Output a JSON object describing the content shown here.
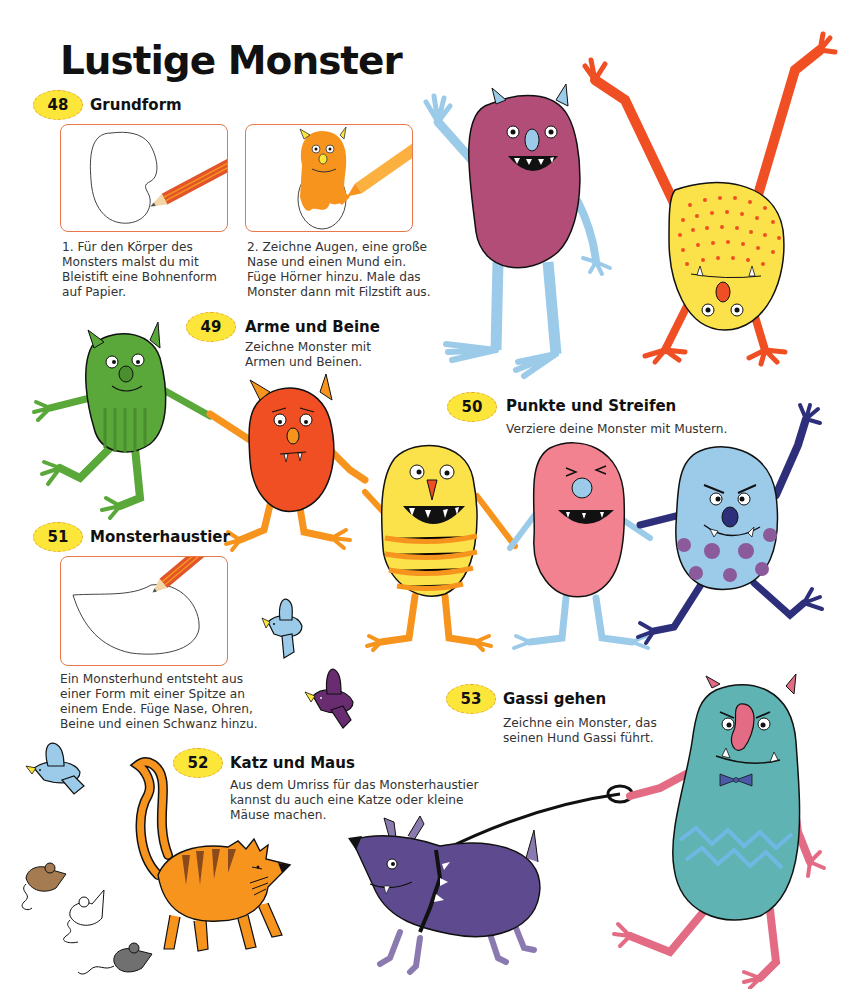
{
  "page": {
    "title": "Lustige Monster"
  },
  "sections": [
    {
      "number": "48",
      "title": "Grundform",
      "steps": [
        {
          "text": "1. Für den Körper des\nMonsters malst du mit\nBleistift eine Bohnenform\nauf Papier."
        },
        {
          "text": "2. Zeichne Augen, eine große\nNase und einen Mund ein.\nFüge Hörner hinzu. Male das\nMonster dann mit Filzstift aus."
        }
      ]
    },
    {
      "number": "49",
      "title": "Arme und Beine",
      "description": "Zeichne Monster mit\nArmen und Beinen."
    },
    {
      "number": "50",
      "title": "Punkte und Streifen",
      "description": "Verziere deine Monster mit Mustern."
    },
    {
      "number": "51",
      "title": "Monsterhaustier",
      "description": "Ein Monsterhund entsteht aus\neiner Form mit einer Spitze an\neinem Ende. Füge Nase, Ohren,\nBeine und einen Schwanz hinzu."
    },
    {
      "number": "52",
      "title": "Katz und Maus",
      "description": "Aus dem Umriss für das Monsterhaustier\nkannst du auch eine Katze oder kleine\nMäuse machen."
    },
    {
      "number": "53",
      "title": "Gassi gehen",
      "description": "Zeichne ein Monster, das\nseinen Hund Gassi führt."
    }
  ],
  "illustrations": [
    {
      "name": "bean-outline-pencil",
      "colors": [
        "#ffffff",
        "#e2542a"
      ]
    },
    {
      "name": "orange-monster-felt-pen",
      "colors": [
        "#f7941d",
        "#fbb040"
      ]
    },
    {
      "name": "magenta-monster-waving",
      "colors": [
        "#b24d77",
        "#9ccbea"
      ]
    },
    {
      "name": "yellow-dotted-monster-handstand",
      "colors": [
        "#fbe14a",
        "#f04e23"
      ]
    },
    {
      "name": "green-monster",
      "colors": [
        "#5aa83a"
      ]
    },
    {
      "name": "red-sad-monster",
      "colors": [
        "#f04e23",
        "#f7941d"
      ]
    },
    {
      "name": "yellow-striped-monster",
      "colors": [
        "#fbe14a",
        "#f7941d"
      ]
    },
    {
      "name": "pink-monster",
      "colors": [
        "#f2828f",
        "#9ccbea"
      ]
    },
    {
      "name": "blue-spotted-monster",
      "colors": [
        "#9ccbea",
        "#2e2f7a",
        "#8a5a9b"
      ]
    },
    {
      "name": "monster-pet-outline",
      "colors": [
        "#ffffff"
      ]
    },
    {
      "name": "blue-bird",
      "colors": [
        "#9ccbea"
      ]
    },
    {
      "name": "purple-bird",
      "colors": [
        "#6a2c70"
      ]
    },
    {
      "name": "orange-cat",
      "colors": [
        "#f7941d",
        "#8b4a1c"
      ]
    },
    {
      "name": "mice",
      "colors": [
        "#a57c52",
        "#ffffff",
        "#707070"
      ]
    },
    {
      "name": "purple-monster-dog",
      "colors": [
        "#5e4a8e"
      ]
    },
    {
      "name": "teal-monster-walking-dog",
      "colors": [
        "#5fb3b3",
        "#e36c84"
      ]
    }
  ],
  "colors": {
    "badge_fill": "#fde63a",
    "badge_border": "#e3a62a",
    "frame_border": "#e8774a"
  }
}
